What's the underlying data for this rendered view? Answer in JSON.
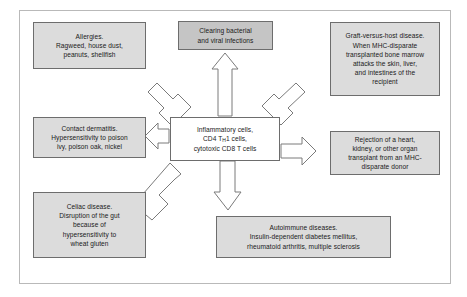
{
  "diagram": {
    "frame_color": "#b9b9b9",
    "node_fill": "#dcdcdc",
    "node_fill_dark": "#c5c5c5",
    "node_fill_center": "#ffffff",
    "node_border": "#6d6d6d",
    "arrow_fill": "#ffffff",
    "arrow_stroke": "#7a7a7a"
  },
  "center": {
    "name": "inflammatory-cells",
    "lines": [
      "Inflammatory cells,",
      "CD4 T",
      "1 cells,",
      "cytotoxic CD8 T cells"
    ],
    "line1": "Inflammatory cells,",
    "line2_pre": "CD4 T",
    "line2_sub": "H",
    "line2_post": "1 cells,",
    "line3": "cytotoxic CD8 T cells"
  },
  "nodes": [
    {
      "id": "allergies",
      "name": "allergies-box",
      "lines": [
        "Allergies.",
        "Ragweed, house dust,",
        "peanuts, shellfish"
      ]
    },
    {
      "id": "clearing",
      "name": "clearing-infections-box",
      "lines": [
        "Clearing bacterial",
        "and viral infections"
      ]
    },
    {
      "id": "gvhd",
      "name": "graft-versus-host-box",
      "lines": [
        "Graft-versus-host disease.",
        "When MHC-disparate",
        "transplanted bone marrow",
        "attacks the skin, liver,",
        "and intestines of the",
        "recipient"
      ]
    },
    {
      "id": "contact",
      "name": "contact-dermatitis-box",
      "lines": [
        "Contact dermatitis.",
        "Hypersensitivity to poison",
        "ivy, poison oak, nickel"
      ]
    },
    {
      "id": "rejection",
      "name": "transplant-rejection-box",
      "lines": [
        "Rejection of a heart,",
        "kidney, or other organ",
        "transplant from an MHC-",
        "disparate donor"
      ]
    },
    {
      "id": "celiac",
      "name": "celiac-disease-box",
      "lines": [
        "Celiac disease.",
        "Disruption of the gut",
        "because of",
        "hypersensitivity to",
        "wheat gluten"
      ]
    },
    {
      "id": "autoimmune",
      "name": "autoimmune-diseases-box",
      "lines": [
        "Autoimmune diseases.",
        "Insulin-dependent diabetes mellitus,",
        "rheumatoid arthritis, multiple sclerosis"
      ]
    }
  ],
  "arrows": [
    {
      "name": "arrow-to-allergies",
      "direction": "up-left"
    },
    {
      "name": "arrow-to-clearing",
      "direction": "up"
    },
    {
      "name": "arrow-to-gvhd",
      "direction": "up-right"
    },
    {
      "name": "arrow-to-contact",
      "direction": "left"
    },
    {
      "name": "arrow-to-rejection",
      "direction": "right"
    },
    {
      "name": "arrow-to-celiac",
      "direction": "down-left"
    },
    {
      "name": "arrow-to-autoimmune",
      "direction": "down"
    }
  ]
}
